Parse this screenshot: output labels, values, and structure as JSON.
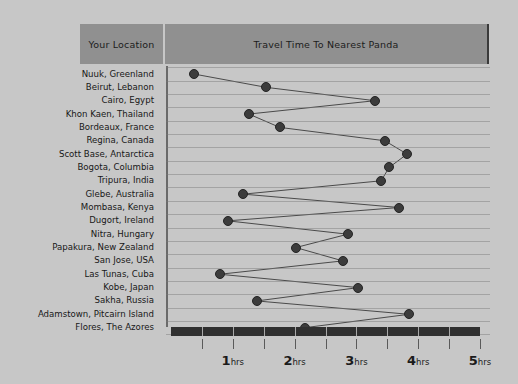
{
  "header": {
    "location_column_label": "Your Location",
    "value_column_label": "Travel Time To Nearest Panda"
  },
  "axis": {
    "tick_labels": [
      "1hrs",
      "2hrs",
      "3hrs",
      "4hrs",
      "5hrs"
    ],
    "tick_numbers": [
      "1",
      "2",
      "3",
      "4",
      "5"
    ],
    "tick_unit": "hrs",
    "minor_tick_step": 0.5
  },
  "colors": {
    "background": "#c7c7c7",
    "header_box": "#909090",
    "marker": "#3c3c3c",
    "line": "#4a4a4a",
    "axis_bar": "#303030",
    "gridline": "#787878",
    "text": "#171717"
  },
  "chart_data": {
    "type": "line",
    "title": "Travel Time To Nearest Panda",
    "xlabel": "",
    "ylabel": "Your Location",
    "xlim": [
      0,
      5
    ],
    "grid": true,
    "legend": "none",
    "orientation": "horizontal-categories",
    "unit": "hrs",
    "categories": [
      "Nuuk, Greenland",
      "Beirut, Lebanon",
      "Cairo, Egypt",
      "Khon Kaen, Thailand",
      "Bordeaux, France",
      "Regina, Canada",
      "Scott Base, Antarctica",
      "Bogota, Columbia",
      "Tripura, India",
      "Glebe, Australia",
      "Mombasa, Kenya",
      "Dugort, Ireland",
      "Nitra, Hungary",
      "Papakura, New Zealand",
      "San Jose, USA",
      "Las Tunas, Cuba",
      "Kobe, Japan",
      "Sakha, Russia",
      "Adamstown, Pitcairn Island",
      "Flores, The Azores"
    ],
    "values": [
      0.37,
      1.54,
      3.3,
      1.26,
      1.76,
      3.46,
      3.82,
      3.53,
      3.4,
      1.17,
      3.69,
      0.92,
      2.86,
      2.02,
      2.78,
      0.79,
      3.03,
      1.39,
      3.85,
      2.17
    ]
  }
}
